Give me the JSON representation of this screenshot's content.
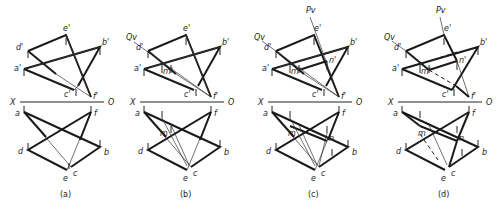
{
  "figure": {
    "axis": {
      "left": "X",
      "right": "O"
    },
    "panels": [
      {
        "caption": "(a)",
        "front": {
          "d": [
            28,
            51
          ],
          "e": [
            66,
            35
          ],
          "b": [
            100,
            47
          ],
          "a": [
            24,
            69
          ],
          "c": [
            74,
            90
          ],
          "f": [
            91,
            97
          ]
        },
        "top": {
          "a": [
            24,
            112
          ],
          "f": [
            91,
            112
          ],
          "d": [
            28,
            150
          ],
          "b": [
            100,
            147
          ],
          "e": [
            67,
            170
          ],
          "c": [
            71,
            167
          ]
        },
        "axis_y": 101,
        "axis_x": [
          18,
          103
        ],
        "labels": {
          "d_": "d'",
          "e_": "e'",
          "b_": "b'",
          "a_": "a'",
          "c_": "c'",
          "f_": "f'",
          "a": "a",
          "f": "f",
          "d": "d",
          "b": "b",
          "e": "e",
          "c": "c"
        }
      },
      {
        "caption": "(b)",
        "trace_Q": "Qv",
        "point_m": "m'",
        "point_m_top": "m",
        "axis_y": 101,
        "axis_x": [
          140,
          226
        ]
      },
      {
        "caption": "(c)",
        "trace_Q": "Qv",
        "trace_P": "Pv",
        "point_m": "m'",
        "point_n": "n'",
        "point_m_top": "m",
        "point_n_top": "n",
        "axis_y": 101,
        "axis_x": [
          268,
          354
        ]
      },
      {
        "caption": "(d)",
        "trace_Q": "Qv",
        "trace_P": "Pv",
        "point_m": "m'",
        "point_n": "n'",
        "point_m_top": "m",
        "point_n_top": "n",
        "axis_y": 101,
        "axis_x": [
          398,
          484
        ]
      }
    ],
    "captions": [
      "(a)",
      "(b)",
      "(c)",
      "(d)"
    ],
    "colors": {
      "background": "#ffffff",
      "line": "#1a1a1a"
    }
  }
}
